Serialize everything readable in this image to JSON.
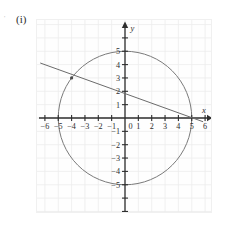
{
  "figure": {
    "label": "(i)",
    "margin_tick": "'"
  },
  "chart_data": {
    "type": "scatter",
    "title": "",
    "xlabel": "x",
    "ylabel": "y",
    "xlim": [
      -6.6,
      6.6
    ],
    "ylim": [
      -6.9,
      7.7
    ],
    "grid": true,
    "grid_step": 1,
    "legend": "none",
    "xticks": [
      -6,
      -5,
      -4,
      -3,
      -2,
      -1,
      0,
      1,
      2,
      3,
      4,
      5,
      6
    ],
    "xticklabels": [
      "-6",
      "-5",
      "-4",
      "-3",
      "-2",
      "-1",
      "0",
      "1",
      "2",
      "3",
      "4",
      "5",
      "6"
    ],
    "yticks": [
      5,
      4,
      3,
      2,
      1,
      0,
      -1,
      -2,
      -3,
      -4,
      -5
    ],
    "yticklabels": [
      "5",
      "4",
      "3",
      "2",
      "1",
      "0",
      "-1",
      "-2",
      "-3",
      "-4",
      "-5"
    ],
    "series": [
      {
        "name": "circle",
        "type": "circle",
        "center": [
          0,
          0
        ],
        "radius": 5,
        "color": "#7a7a7a"
      },
      {
        "name": "line",
        "type": "line",
        "points": [
          [
            -6.35,
            4.12
          ],
          [
            5.85,
            -0.28
          ]
        ],
        "through": [
          [
            -4,
            3
          ],
          [
            5,
            0
          ]
        ],
        "slope": -0.3333,
        "intercept": 1.6667,
        "color": "#6b6b6b"
      },
      {
        "name": "marked-point",
        "type": "point",
        "coords": [
          -4,
          3
        ],
        "color": "#4a4a4a"
      }
    ],
    "colors": {
      "grid": "#ececec",
      "axis": "#2e2e2e",
      "curve": "#7a7a7a",
      "line": "#6b6b6b",
      "background": "#fefefe"
    }
  }
}
